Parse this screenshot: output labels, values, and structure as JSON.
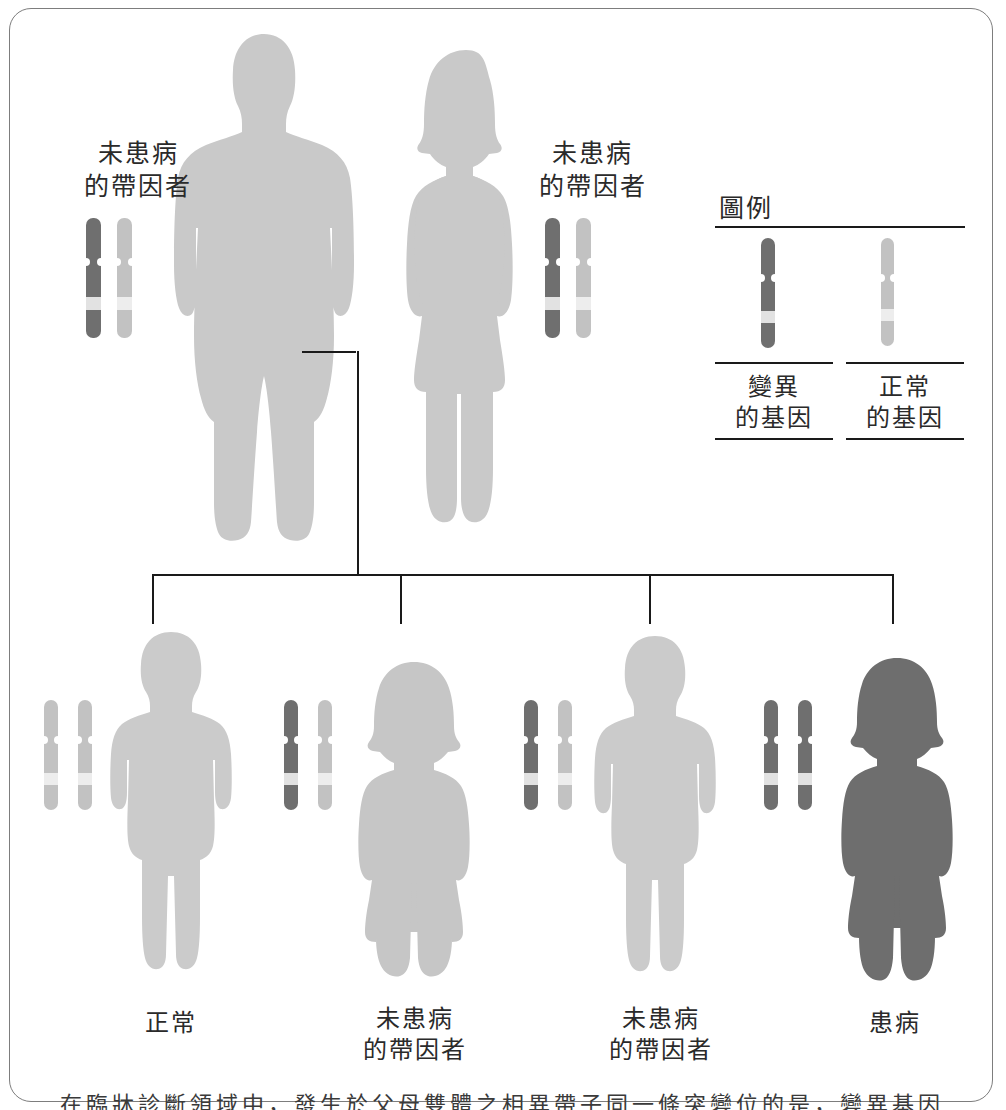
{
  "diagram": {
    "title_visible": false,
    "type": "pedigree-autosomal-recessive",
    "colors": {
      "mutated_gene": "#6f6f6f",
      "normal_gene": "#c2c2c2",
      "chromosome_band": "#e2e2e2",
      "unaffected_silhouette": "#c9c9c9",
      "carrier_silhouette": "#c4c4c4",
      "affected_silhouette": "#6e6e6e",
      "line": "#1a1a1a",
      "frame": "#7d7d7d",
      "text": "#2a2a2a"
    }
  },
  "parents": [
    {
      "id": "father",
      "sex": "male",
      "label": "未患病\n的帶因者",
      "status": "carrier",
      "chromosomes": [
        "mutated",
        "normal"
      ]
    },
    {
      "id": "mother",
      "sex": "female",
      "label": "未患病\n的帶因者",
      "status": "carrier",
      "chromosomes": [
        "mutated",
        "normal"
      ]
    }
  ],
  "children": [
    {
      "id": "child-1",
      "sex": "male",
      "label": "正常",
      "status": "normal",
      "chromosomes": [
        "normal",
        "normal"
      ]
    },
    {
      "id": "child-2",
      "sex": "female",
      "label": "未患病\n的帶因者",
      "status": "carrier",
      "chromosomes": [
        "mutated",
        "normal"
      ]
    },
    {
      "id": "child-3",
      "sex": "male",
      "label": "未患病\n的帶因者",
      "status": "carrier",
      "chromosomes": [
        "mutated",
        "normal"
      ]
    },
    {
      "id": "child-4",
      "sex": "female",
      "label": "患病",
      "status": "affected",
      "chromosomes": [
        "mutated",
        "mutated"
      ]
    }
  ],
  "legend": {
    "title": "圖例",
    "items": [
      {
        "id": "mutated",
        "label": "變異\n的基因",
        "gene_type": "mutated"
      },
      {
        "id": "normal",
        "label": "正常\n的基因",
        "gene_type": "normal"
      }
    ]
  },
  "caption": {
    "text": "在臨牀診斷領域中，發生於父母雙體之相異帶子同一條突變位的是，變異基因，上界分母體之"
  }
}
